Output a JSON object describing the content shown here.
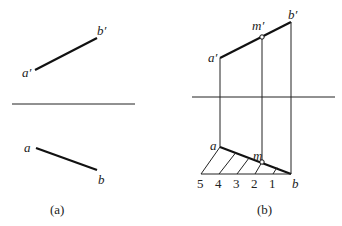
{
  "figure_a": {
    "caption": "(a)",
    "labels": {
      "a_prime": "a′",
      "b_prime": "b′",
      "a": "a",
      "b": "b"
    },
    "points": {
      "a_prime": [
        35,
        70
      ],
      "b_prime": [
        97,
        38
      ],
      "a": [
        36,
        148
      ],
      "b": [
        97,
        170
      ]
    },
    "axis": {
      "x1": 12,
      "x2": 135,
      "y": 104
    }
  },
  "figure_b": {
    "caption": "(b)",
    "labels": {
      "a_prime": "a′",
      "b_prime": "b′",
      "m_prime": "m′",
      "a": "a",
      "b": "b",
      "m": "m"
    },
    "division_labels": [
      "5",
      "4",
      "3",
      "2",
      "1"
    ],
    "points": {
      "a_prime": [
        220,
        58
      ],
      "m_prime": [
        262,
        36
      ],
      "b_prime": [
        291,
        22
      ],
      "a": [
        220,
        147
      ],
      "m": [
        262,
        162
      ],
      "b": [
        291,
        174
      ]
    },
    "axis": {
      "x1": 192,
      "x2": 335,
      "y": 97
    },
    "base_line": {
      "x1": 201,
      "x2": 291,
      "y": 174
    },
    "division_points_x": [
      201,
      219,
      237,
      255,
      273
    ]
  }
}
